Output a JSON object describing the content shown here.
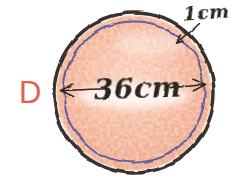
{
  "figure": {
    "label": "D",
    "diameter_label": "36cm",
    "ring_width_label": "1cm"
  },
  "colors": {
    "paper": "#ffffff",
    "label": "#e2604f",
    "outline": "#38322e",
    "inner_ring": "#51549c",
    "fill_light": "#f9cab1",
    "fill_base": "#f3aa8a",
    "fill_edge": "#eb9876",
    "ink": "#2b2723"
  }
}
